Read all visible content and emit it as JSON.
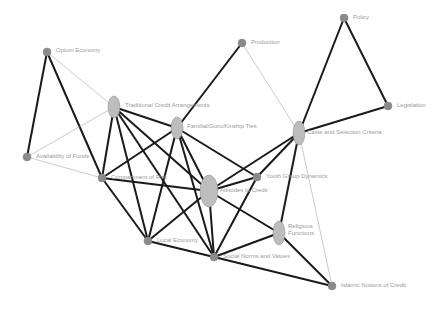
{
  "diagram": {
    "type": "network",
    "colors": {
      "thick_edge": "#1a1a1a",
      "thin_edge": "#a8a8a8",
      "node_fill": "#bdbdbd",
      "small_node_fill": "#8a8a8a",
      "label": "#9a9a9a"
    },
    "nodes": [
      {
        "id": "opium",
        "label": "Opium Economy",
        "x": 47,
        "y": 52,
        "rx": 4,
        "ry": 4,
        "lx": 56,
        "ly": 47
      },
      {
        "id": "production",
        "label": "Production",
        "x": 242,
        "y": 43,
        "rx": 4,
        "ry": 4,
        "lx": 251,
        "ly": 39
      },
      {
        "id": "policy",
        "label": "Policy",
        "x": 344,
        "y": 18,
        "rx": 4,
        "ry": 4,
        "lx": 353,
        "ly": 14
      },
      {
        "id": "legislation",
        "label": "Legislation",
        "x": 388,
        "y": 106,
        "rx": 4,
        "ry": 4,
        "lx": 397,
        "ly": 102
      },
      {
        "id": "traditional",
        "label": "Traditional Credit Arrangements",
        "x": 114,
        "y": 107,
        "rx": 6,
        "ry": 11,
        "lx": 125,
        "ly": 102
      },
      {
        "id": "familial",
        "label": "Familial/Guru/Kinship Ties",
        "x": 177,
        "y": 128,
        "rx": 6,
        "ry": 11,
        "lx": 187,
        "ly": 123
      },
      {
        "id": "caste",
        "label": "Caste and Selection Criteria",
        "x": 299,
        "y": 133,
        "rx": 6,
        "ry": 12,
        "lx": 307,
        "ly": 129
      },
      {
        "id": "availability",
        "label": "Availability of Funds",
        "x": 27,
        "y": 157,
        "rx": 4,
        "ry": 4,
        "lx": 36,
        "ly": 153
      },
      {
        "id": "consumption",
        "label": "Compartment of Risk",
        "x": 102,
        "y": 178,
        "rx": 4,
        "ry": 4,
        "lx": 111,
        "ly": 174
      },
      {
        "id": "youth",
        "label": "Youth Group Dynamics",
        "x": 257,
        "y": 177,
        "rx": 4,
        "ry": 4,
        "lx": 266,
        "ly": 173
      },
      {
        "id": "tatal",
        "label": "Attitudes to Credit",
        "x": 209,
        "y": 191,
        "rx": 9,
        "ry": 16,
        "lx": 220,
        "ly": 187
      },
      {
        "id": "religious",
        "label": "Religious Functions",
        "x": 279,
        "y": 233,
        "rx": 6,
        "ry": 12,
        "lx": 288,
        "ly": 223,
        "lines": [
          "Religious",
          "Functions"
        ]
      },
      {
        "id": "local",
        "label": "Local Economy",
        "x": 148,
        "y": 241,
        "rx": 4,
        "ry": 4,
        "lx": 157,
        "ly": 237
      },
      {
        "id": "social",
        "label": "Social Norms and Values",
        "x": 214,
        "y": 257,
        "rx": 4,
        "ry": 4,
        "lx": 223,
        "ly": 253
      },
      {
        "id": "islamic",
        "label": "Islamic Notions of Credit",
        "x": 332,
        "y": 286,
        "rx": 4,
        "ry": 4,
        "lx": 341,
        "ly": 282
      }
    ],
    "edges": [
      {
        "from": "opium",
        "to": "availability",
        "w": "thick"
      },
      {
        "from": "opium",
        "to": "consumption",
        "w": "thick"
      },
      {
        "from": "opium",
        "to": "traditional",
        "w": "thin"
      },
      {
        "from": "availability",
        "to": "traditional",
        "w": "thin"
      },
      {
        "from": "consumption",
        "to": "availability",
        "w": "thin"
      },
      {
        "from": "production",
        "to": "familial",
        "w": "thick"
      },
      {
        "from": "production",
        "to": "caste",
        "w": "thin"
      },
      {
        "from": "policy",
        "to": "caste",
        "w": "thick"
      },
      {
        "from": "policy",
        "to": "legislation",
        "w": "thick"
      },
      {
        "from": "legislation",
        "to": "caste",
        "w": "thick"
      },
      {
        "from": "traditional",
        "to": "familial",
        "w": "thick"
      },
      {
        "from": "traditional",
        "to": "consumption",
        "w": "thick"
      },
      {
        "from": "traditional",
        "to": "local",
        "w": "thick"
      },
      {
        "from": "traditional",
        "to": "tatal",
        "w": "thick"
      },
      {
        "from": "traditional",
        "to": "social",
        "w": "thick"
      },
      {
        "from": "familial",
        "to": "consumption",
        "w": "thick"
      },
      {
        "from": "familial",
        "to": "local",
        "w": "thick"
      },
      {
        "from": "familial",
        "to": "tatal",
        "w": "thick"
      },
      {
        "from": "familial",
        "to": "youth",
        "w": "thick"
      },
      {
        "from": "familial",
        "to": "social",
        "w": "thick"
      },
      {
        "from": "consumption",
        "to": "tatal",
        "w": "thick"
      },
      {
        "from": "consumption",
        "to": "local",
        "w": "thick"
      },
      {
        "from": "caste",
        "to": "tatal",
        "w": "thick"
      },
      {
        "from": "caste",
        "to": "youth",
        "w": "thick"
      },
      {
        "from": "caste",
        "to": "religious",
        "w": "thick"
      },
      {
        "from": "caste",
        "to": "islamic",
        "w": "thin"
      },
      {
        "from": "youth",
        "to": "tatal",
        "w": "thick"
      },
      {
        "from": "youth",
        "to": "social",
        "w": "thick"
      },
      {
        "from": "tatal",
        "to": "local",
        "w": "thick"
      },
      {
        "from": "tatal",
        "to": "social",
        "w": "thick"
      },
      {
        "from": "tatal",
        "to": "religious",
        "w": "thick"
      },
      {
        "from": "local",
        "to": "social",
        "w": "thick"
      },
      {
        "from": "social",
        "to": "religious",
        "w": "thick"
      },
      {
        "from": "social",
        "to": "islamic",
        "w": "thick"
      },
      {
        "from": "religious",
        "to": "islamic",
        "w": "thick"
      }
    ]
  }
}
